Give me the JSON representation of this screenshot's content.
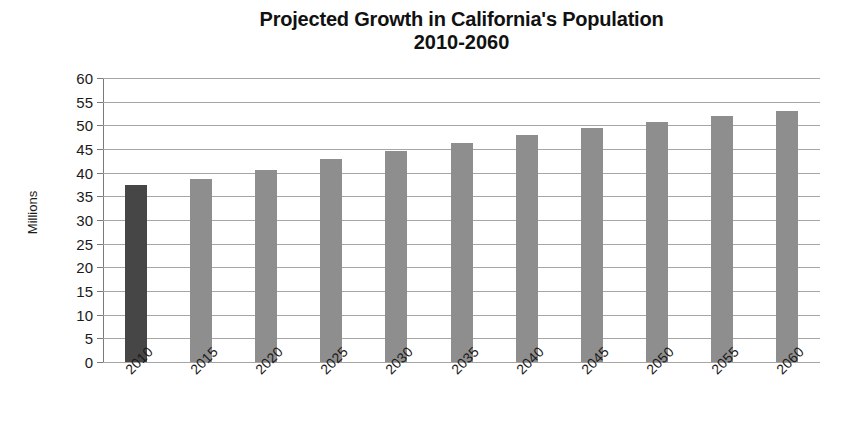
{
  "chart_data": {
    "type": "bar",
    "title": "Projected Growth in California's Population",
    "subtitle": "2010-2060",
    "xlabel": "",
    "ylabel": "Millions",
    "categories": [
      "2010",
      "2015",
      "2020",
      "2025",
      "2030",
      "2035",
      "2040",
      "2045",
      "2050",
      "2055",
      "2060"
    ],
    "values": [
      37.3,
      38.7,
      40.5,
      42.8,
      44.5,
      46.3,
      48.0,
      49.4,
      50.7,
      51.9,
      53.0
    ],
    "series": [
      {
        "name": "California population",
        "values": [
          37.3,
          38.7,
          40.5,
          42.8,
          44.5,
          46.3,
          48.0,
          49.4,
          50.7,
          51.9,
          53.0
        ]
      }
    ],
    "bar_colors": [
      "#464646",
      "#8e8e8e",
      "#8e8e8e",
      "#8e8e8e",
      "#8e8e8e",
      "#8e8e8e",
      "#8e8e8e",
      "#8e8e8e",
      "#8e8e8e",
      "#8e8e8e",
      "#8e8e8e"
    ],
    "highlight_note": "2010 bar is drawn darker than the projected years",
    "ylim": [
      0,
      60
    ],
    "ytick_step": 5,
    "ytick_labels": [
      "60",
      "55",
      "50",
      "45",
      "40",
      "35",
      "30",
      "25",
      "20",
      "15",
      "10",
      "5",
      "0"
    ],
    "ytick_values": [
      60,
      55,
      50,
      45,
      40,
      35,
      30,
      25,
      20,
      15,
      10,
      5,
      0
    ],
    "grid": true,
    "grid_axis": "y",
    "gridline_color": "#a6a6a6",
    "legend": false,
    "legend_position": "none",
    "xtick_label_rotation": -45,
    "background_color": "#ffffff",
    "text_color": "#1a1a1a"
  }
}
